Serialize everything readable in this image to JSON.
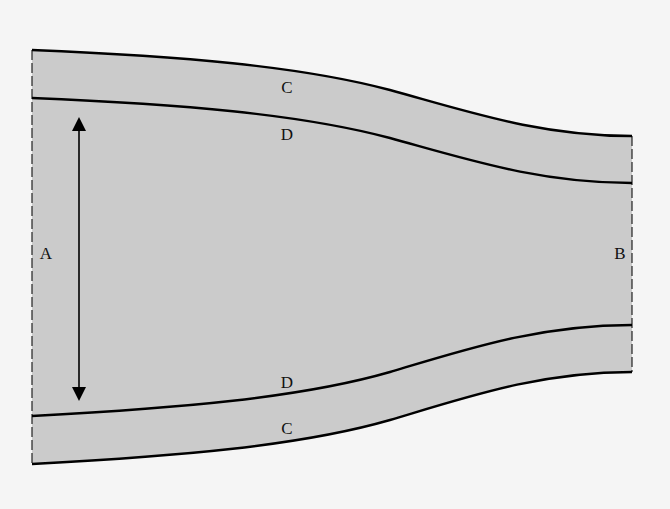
{
  "diagram": {
    "type": "converging-channel-cross-section",
    "colors": {
      "background": "#f5f5f5",
      "fill": "#cbcbcb",
      "line": "#000000",
      "text": "#111111"
    },
    "labels": {
      "inlet": "A",
      "outlet": "B",
      "outer_wall_top": "C",
      "inner_wall_top": "D",
      "inner_wall_bottom": "D",
      "outer_wall_bottom": "C"
    },
    "arrow": {
      "description": "double-headed vertical arrow spanning inner channel width at inlet"
    }
  }
}
